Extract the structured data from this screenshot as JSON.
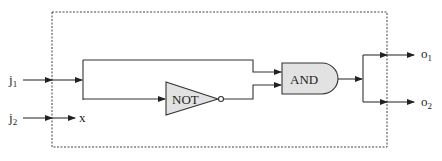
{
  "diagram": {
    "type": "logic-circuit",
    "boundary": "dashed-box",
    "inputs": [
      {
        "id": "j1",
        "label": "j",
        "subscript": "1"
      },
      {
        "id": "j2",
        "label": "j",
        "subscript": "2"
      }
    ],
    "internal_signal": {
      "label": "x"
    },
    "gates": [
      {
        "id": "not",
        "label": "NOT",
        "shape": "triangle-with-bubble"
      },
      {
        "id": "and",
        "label": "AND",
        "shape": "and-gate"
      }
    ],
    "outputs": [
      {
        "id": "o1",
        "label": "o",
        "subscript": "1"
      },
      {
        "id": "o2",
        "label": "o",
        "subscript": "2"
      }
    ],
    "connections": [
      "j1 -> split",
      "split -> AND (top input)",
      "split -> NOT",
      "NOT -> AND (bottom input)",
      "AND -> split2",
      "split2 -> o1",
      "split2 -> o2",
      "j2 -> x"
    ],
    "colors": {
      "gate_fill": "#e2e2e2",
      "line": "#333333"
    }
  }
}
